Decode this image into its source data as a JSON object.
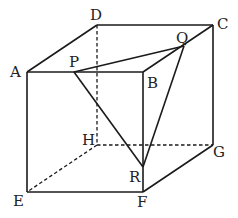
{
  "figure": {
    "type": "cube-with-cross-section",
    "vertices": {
      "A": {
        "label": "A",
        "x": 27,
        "y": 72
      },
      "B": {
        "label": "B",
        "x": 143,
        "y": 72
      },
      "C": {
        "label": "C",
        "x": 213,
        "y": 25
      },
      "D": {
        "label": "D",
        "x": 97,
        "y": 25
      },
      "E": {
        "label": "E",
        "x": 27,
        "y": 192
      },
      "F": {
        "label": "F",
        "x": 143,
        "y": 192
      },
      "G": {
        "label": "G",
        "x": 213,
        "y": 145
      },
      "H": {
        "label": "H",
        "x": 97,
        "y": 145
      },
      "P": {
        "label": "P",
        "x": 74,
        "y": 72
      },
      "Q": {
        "label": "Q",
        "x": 184,
        "y": 46
      },
      "R": {
        "label": "R",
        "x": 143,
        "y": 167
      }
    },
    "labels": {
      "A": "A",
      "B": "B",
      "C": "C",
      "D": "D",
      "E": "E",
      "F": "F",
      "G": "G",
      "H": "H",
      "P": "P",
      "Q": "Q",
      "R": "R"
    },
    "solid_edges": [
      "AB",
      "BC",
      "CD",
      "DA",
      "AE",
      "EF",
      "BF",
      "FG",
      "CG",
      "PQ",
      "QR",
      "RP",
      "QC"
    ],
    "hidden_edges": [
      "DH",
      "HE",
      "HG"
    ],
    "line_color": "#1a1a1a"
  }
}
